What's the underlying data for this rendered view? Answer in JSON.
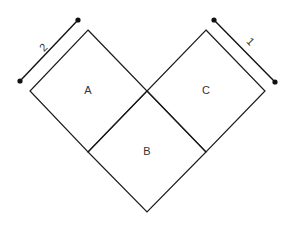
{
  "diagram": {
    "squares": [
      {
        "id": "A",
        "label": "A"
      },
      {
        "id": "B",
        "label": "B"
      },
      {
        "id": "C",
        "label": "C"
      }
    ],
    "dimensions": [
      {
        "side": "left",
        "label": "2"
      },
      {
        "side": "right",
        "label": "1"
      }
    ],
    "colors": {
      "stroke": "#1a1a1a",
      "background": "#ffffff"
    }
  }
}
